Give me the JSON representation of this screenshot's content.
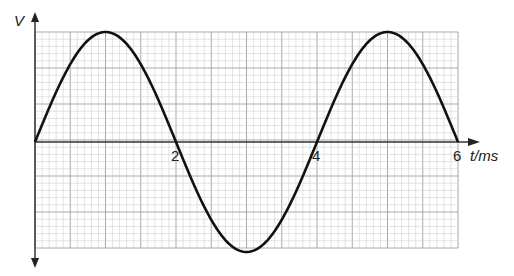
{
  "chart_data": {
    "type": "line",
    "title": "",
    "xlabel": "t/ms",
    "ylabel": "V",
    "xlim": [
      0,
      6
    ],
    "x_ticks": [
      "2",
      "4",
      "6"
    ],
    "grid": true,
    "series": [
      {
        "name": "V",
        "x": [
          0,
          0.5,
          1,
          1.5,
          2,
          2.5,
          3,
          3.5,
          4,
          4.5,
          5,
          5.5,
          6
        ],
        "values": [
          0,
          0.707,
          1,
          0.707,
          0,
          -0.707,
          -1,
          -0.707,
          0,
          0.707,
          1,
          0.707,
          0
        ]
      }
    ]
  },
  "axes": {
    "y_label": "V",
    "x_label": "t/ms",
    "x_tick_labels": [
      "2",
      "4",
      "6"
    ]
  },
  "colors": {
    "curve": "#111111",
    "axis": "#333333",
    "grid_minor": "#d0d0d0",
    "grid_major": "#a8a8a8"
  }
}
